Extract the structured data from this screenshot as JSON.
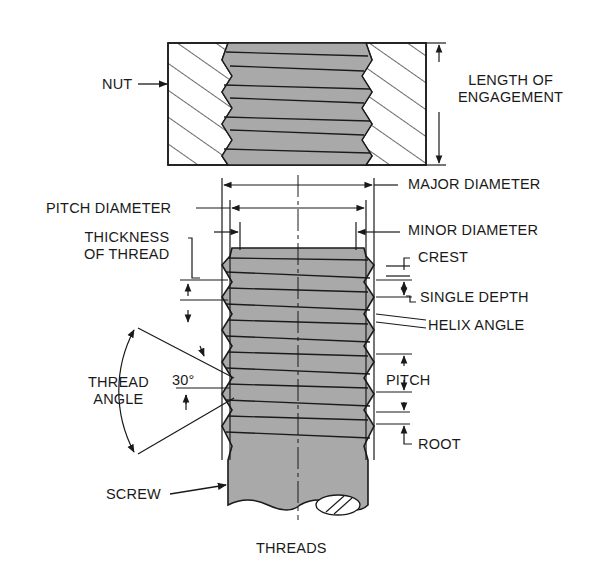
{
  "title": "THREADS",
  "colors": {
    "ink": "#1a1a1a",
    "thread_fill": "#a9a9a9",
    "background": "#ffffff"
  },
  "nut": {
    "label": "NUT",
    "length_label": "LENGTH OF\nENGAGEMENT"
  },
  "screw": {
    "label": "SCREW"
  },
  "labels": {
    "major_diameter": "MAJOR DIAMETER",
    "pitch_diameter": "PITCH DIAMETER",
    "minor_diameter": "MINOR DIAMETER",
    "thickness_of_thread": "THICKNESS\nOF THREAD",
    "crest": "CREST",
    "single_depth": "SINGLE DEPTH",
    "helix_angle": "HELIX ANGLE",
    "pitch": "PITCH",
    "root": "ROOT",
    "thread_angle": "THREAD\nANGLE",
    "angle_value": "30°"
  }
}
